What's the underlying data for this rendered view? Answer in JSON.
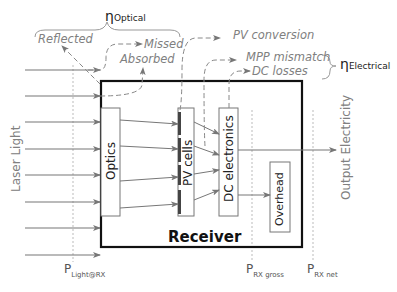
{
  "eta_optical": {
    "symbol": "η",
    "sub": "Optical"
  },
  "eta_electrical": {
    "symbol": "η",
    "sub": "Electrical"
  },
  "losses": {
    "reflected": "Reflected",
    "missed": "Missed",
    "absorbed": "Absorbed",
    "pv_conversion": "PV conversion",
    "mpp_mismatch": "MPP mismatch",
    "dc_losses": "DC losses"
  },
  "input_label": "Laser Light",
  "output_label": "Output Electricity",
  "blocks": {
    "optics": "Optics",
    "pv_cells": "PV cells",
    "dc_electronics": "DC electronics",
    "overhead": "Overhead",
    "receiver": "Receiver"
  },
  "measurement_points": [
    {
      "p": "P",
      "sub": "Light@RX"
    },
    {
      "p": "P",
      "sub": "RX gross"
    },
    {
      "p": "P",
      "sub": "RX net"
    }
  ]
}
